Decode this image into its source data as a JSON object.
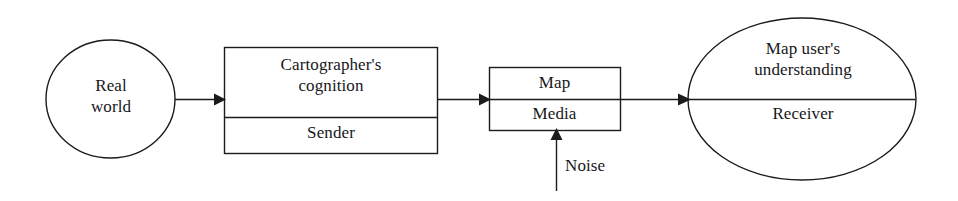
{
  "diagram": {
    "type": "flow-diagram",
    "stroke_color": "#1b1b1b",
    "background_color": "#ffffff",
    "text_color": "#17171a",
    "nodes": [
      {
        "id": "real-world",
        "shape": "ellipse",
        "label": "Real\nworld",
        "sections": [
          "Real world"
        ]
      },
      {
        "id": "cartographer",
        "shape": "rectangle",
        "divided": true,
        "upper_label": "Cartographer's\ncognition",
        "lower_label": "Sender"
      },
      {
        "id": "map-media",
        "shape": "rectangle",
        "divided": true,
        "upper_label": "Map",
        "lower_label": "Media"
      },
      {
        "id": "map-user",
        "shape": "ellipse",
        "divided": true,
        "upper_label": "Map user's\nunderstanding",
        "lower_label": "Receiver"
      }
    ],
    "edges": [
      {
        "id": "edge-world-to-cartographer",
        "from": "real-world",
        "to": "cartographer",
        "label": ""
      },
      {
        "id": "edge-cartographer-to-map",
        "from": "cartographer",
        "to": "map-media",
        "label": ""
      },
      {
        "id": "edge-map-to-user",
        "from": "map-media",
        "to": "map-user",
        "label": ""
      },
      {
        "id": "edge-noise-to-map",
        "from": "noise",
        "to": "map-media",
        "label": "Noise",
        "direction": "upward"
      }
    ],
    "annotations": {
      "noise_label": "Noise"
    }
  }
}
